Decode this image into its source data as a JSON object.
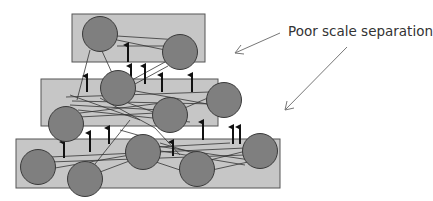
{
  "annotation": {
    "label": "Poor scale separation",
    "arrow_count": 2
  },
  "colors": {
    "box_fill": "#c6c6c6",
    "box_stroke": "#555555",
    "node_fill": "#7f7f7f",
    "node_stroke": "#3a3a3a",
    "edge": "#333333",
    "arrow": "#111111",
    "annotation_arrow": "#777777"
  },
  "layers": [
    {
      "name": "top-layer",
      "node_count": 2
    },
    {
      "name": "middle-layer",
      "node_count": 4
    },
    {
      "name": "bottom-layer",
      "node_count": 5
    }
  ]
}
